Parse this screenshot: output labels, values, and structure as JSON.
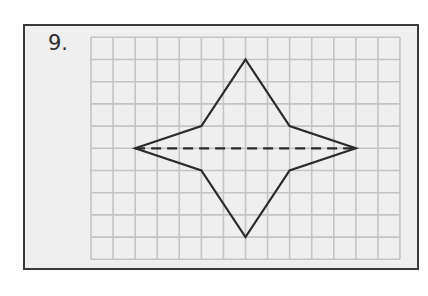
{
  "problem": {
    "number_label": "9."
  },
  "grid": {
    "columns": 14,
    "rows": 10,
    "origin_px": [
      91,
      37.3
    ],
    "cell_w_px": 22.07,
    "cell_h_px": 22.2,
    "line_color": "#c4c4c4"
  },
  "colors": {
    "panel_background": "#efefef",
    "panel_border": "#3a3a3a",
    "shape_stroke": "#2b2b2b",
    "label_color": "#2e2e2e"
  },
  "shape": {
    "name": "four-pointed star",
    "vertices_grid": [
      [
        2,
        5
      ],
      [
        5,
        4
      ],
      [
        7,
        1
      ],
      [
        9,
        4
      ],
      [
        12,
        5
      ],
      [
        9,
        6
      ],
      [
        7,
        9
      ],
      [
        5,
        6
      ]
    ]
  },
  "symmetry_line": {
    "style": "dashed",
    "from_grid": [
      2,
      5
    ],
    "to_grid": [
      12,
      5
    ]
  }
}
